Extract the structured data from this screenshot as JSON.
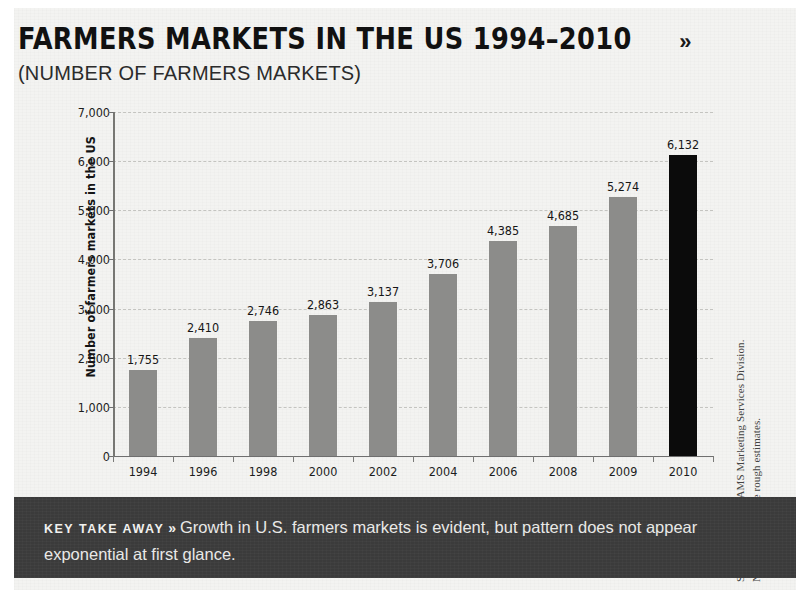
{
  "header": {
    "title": "FARMERS MARKETS IN THE US 1994–2010",
    "chevron": "»",
    "subtitle": "(NUMBER OF FARMERS MARKETS)"
  },
  "source": {
    "line1": "SOURCE: USDA/AMS Marketing Services Division.",
    "line2": "NOTE: All data are rough estimates."
  },
  "takeaway": {
    "label": "KEY TAKE AWAY",
    "chevron": "»",
    "text": "Growth in U.S. farmers markets is evident, but pattern does not appear exponential at first glance."
  },
  "colors": {
    "page_background": "#f3f3f1",
    "bar": "#8c8c8a",
    "bar_highlight": "#0b0b0b",
    "axis": "#777773",
    "gridline": "#c4c4c0",
    "takeaway_background": "#3b3b3b",
    "takeaway_text": "#ededeb",
    "title_text": "#111111"
  },
  "chart_data": {
    "type": "bar",
    "title": "FARMERS MARKETS IN THE US 1994–2010",
    "subtitle": "(NUMBER OF FARMERS MARKETS)",
    "xlabel": "",
    "ylabel": "Number of farmers markets in the US",
    "categories": [
      "1994",
      "1996",
      "1998",
      "2000",
      "2002",
      "2004",
      "2006",
      "2008",
      "2009",
      "2010"
    ],
    "values": [
      1755,
      2410,
      2746,
      2863,
      3137,
      3706,
      4385,
      4685,
      5274,
      6132
    ],
    "value_labels": [
      "1,755",
      "2,410",
      "2,746",
      "2,863",
      "3,137",
      "3,706",
      "4,385",
      "4,685",
      "5,274",
      "6,132"
    ],
    "highlight_index": 9,
    "ylim": [
      0,
      7000
    ],
    "yticks": [
      0,
      1000,
      2000,
      3000,
      4000,
      5000,
      6000,
      7000
    ],
    "ytick_labels": [
      "0",
      "1,000",
      "2,000",
      "3,000",
      "4,000",
      "5,000",
      "6,000",
      "7,000"
    ],
    "grid": true,
    "grid_axis": "y",
    "grid_style": "dashed",
    "legend": false,
    "legend_position": "none"
  }
}
